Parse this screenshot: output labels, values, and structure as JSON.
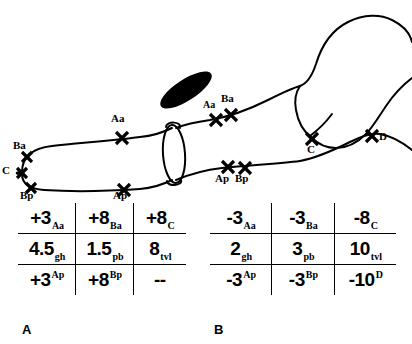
{
  "figure": {
    "panels": [
      {
        "id": "A",
        "label": "A",
        "caption_position": "bottom-left",
        "rows": [
          {
            "cells": [
              {
                "value": "+3",
                "script": "Aa",
                "script_pos": "sub"
              },
              {
                "value": "+8",
                "script": "Ba",
                "script_pos": "sub"
              },
              {
                "value": "+8",
                "script": "C",
                "script_pos": "sub"
              }
            ]
          },
          {
            "cells": [
              {
                "value": "4.5",
                "script": "gh",
                "script_pos": "sub"
              },
              {
                "value": "1.5",
                "script": "pb",
                "script_pos": "sub"
              },
              {
                "value": "8",
                "script": "tvl",
                "script_pos": "sub"
              }
            ]
          },
          {
            "cells": [
              {
                "value": "+3",
                "script": "Ap",
                "script_pos": "sup"
              },
              {
                "value": "+8",
                "script": "Bp",
                "script_pos": "sup"
              },
              {
                "value": "--",
                "script": "",
                "script_pos": "sup"
              }
            ]
          }
        ]
      },
      {
        "id": "B",
        "label": "B",
        "caption_position": "bottom-left",
        "rows": [
          {
            "cells": [
              {
                "value": "-3",
                "script": "Aa",
                "script_pos": "sub"
              },
              {
                "value": "-3",
                "script": "Ba",
                "script_pos": "sub"
              },
              {
                "value": "-8",
                "script": "C",
                "script_pos": "sub"
              }
            ]
          },
          {
            "cells": [
              {
                "value": "2",
                "script": "gh",
                "script_pos": "sub"
              },
              {
                "value": "3",
                "script": "pb",
                "script_pos": "sub"
              },
              {
                "value": "10",
                "script": "tvl",
                "script_pos": "sub"
              }
            ]
          },
          {
            "cells": [
              {
                "value": "-3",
                "script": "Ap",
                "script_pos": "sup"
              },
              {
                "value": "-3",
                "script": "Bp",
                "script_pos": "sup"
              },
              {
                "value": "-10",
                "script": "D",
                "script_pos": "sup"
              }
            ]
          }
        ]
      }
    ],
    "markers": [
      {
        "name": "Ba",
        "label": "Ba",
        "x": 27,
        "y": 157,
        "label_x": 13,
        "label_y": 140
      },
      {
        "name": "C",
        "label": "C",
        "x": 22,
        "y": 173,
        "label_x": 2,
        "label_y": 166
      },
      {
        "name": "Bp",
        "label": "Bp",
        "x": 31,
        "y": 188,
        "label_x": 20,
        "label_y": 190
      },
      {
        "name": "Aa-left",
        "label": "Aa",
        "x": 122,
        "y": 138,
        "label_x": 112,
        "label_y": 116
      },
      {
        "name": "Ap-left",
        "label": "Ap",
        "x": 124,
        "y": 190,
        "label_x": 114,
        "label_y": 190
      },
      {
        "name": "Aa-right",
        "label": "Aa",
        "x": 216,
        "y": 120,
        "label_x": 205,
        "label_y": 103
      },
      {
        "name": "Ba-right",
        "label": "Ba",
        "x": 231,
        "y": 115,
        "label_x": 223,
        "label_y": 96
      },
      {
        "name": "Ap-right",
        "label": "Ap",
        "x": 228,
        "y": 167,
        "label_x": 216,
        "label_y": 174
      },
      {
        "name": "Bp-right",
        "label": "Bp",
        "x": 245,
        "y": 168,
        "label_x": 235,
        "label_y": 174
      },
      {
        "name": "C-right",
        "label": "C",
        "x": 312,
        "y": 139,
        "label_x": 308,
        "label_y": 145
      },
      {
        "name": "D",
        "label": "D",
        "x": 372,
        "y": 136,
        "label_x": 379,
        "label_y": 138
      }
    ],
    "colors": {
      "ink": "#000000",
      "background": "#ffffff"
    },
    "shapes": {
      "filled_ellipse": "black-oval",
      "ring_ellipse": "outlined-oval",
      "hand": "hand-outline",
      "penis_shaft": "shaft-outline"
    }
  }
}
